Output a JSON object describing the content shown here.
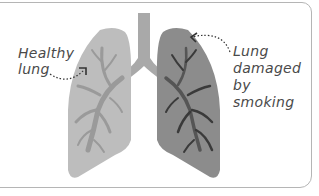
{
  "labels": {
    "healthy": [
      "Healthy",
      "lung"
    ],
    "damaged": [
      "Lung",
      "damaged by",
      "smoking"
    ]
  },
  "colors": {
    "healthy_lung": "#bdbdbd",
    "healthy_bronchi": "#9a9a9a",
    "damaged_lung": "#8c8c8c",
    "damaged_bronchi": "#3a3a3a",
    "trachea": "#a9a9a9",
    "text": "#4a4a4a",
    "border": "#b5b5b5"
  }
}
